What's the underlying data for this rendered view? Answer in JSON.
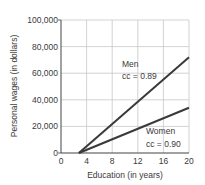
{
  "chart_data": {
    "type": "line",
    "title": "",
    "xlabel": "Education (in years)",
    "ylabel": "Personal wages (in dollars)",
    "xlim": [
      0,
      20
    ],
    "ylim": [
      0,
      100000
    ],
    "x_ticks": [
      "0",
      "4",
      "8",
      "12",
      "16",
      "20"
    ],
    "y_ticks": [
      "0",
      "20,000",
      "40,000",
      "60,000",
      "80,000",
      "100,000"
    ],
    "grid": true,
    "legend": "none",
    "series": [
      {
        "name": "Men",
        "annotation": "cc = 0.89",
        "x": [
          2.8,
          20
        ],
        "y": [
          0,
          72000
        ]
      },
      {
        "name": "Women",
        "annotation": "cc = 0.90",
        "x": [
          2.8,
          20
        ],
        "y": [
          0,
          34000
        ]
      }
    ]
  },
  "labels": {
    "men": "Men",
    "men_cc": "cc = 0.89",
    "women": "Women",
    "women_cc": "cc = 0.90"
  }
}
